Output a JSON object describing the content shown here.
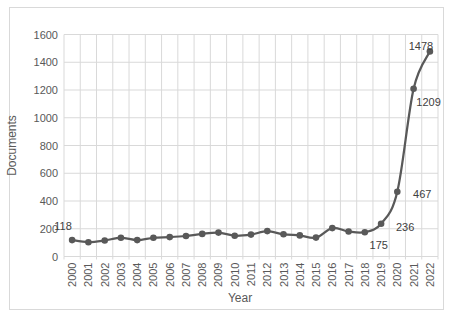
{
  "figure": {
    "background": "#ffffff",
    "border_color": "#d9d9d9"
  },
  "chart_data": {
    "type": "line",
    "title": "",
    "xlabel": "Year",
    "ylabel": "Documents",
    "categories": [
      "2000",
      "2001",
      "2002",
      "2003",
      "2004",
      "2005",
      "2006",
      "2007",
      "2008",
      "2009",
      "2010",
      "2011",
      "2012",
      "2013",
      "2014",
      "2015",
      "2016",
      "2017",
      "2018",
      "2019",
      "2020",
      "2021",
      "2022"
    ],
    "series": [
      {
        "name": "Documents",
        "values": [
          118,
          103,
          115,
          135,
          118,
          135,
          140,
          148,
          163,
          172,
          150,
          158,
          183,
          160,
          152,
          136,
          205,
          180,
          175,
          236,
          467,
          1209,
          1478
        ]
      }
    ],
    "ylim": [
      0,
      1600
    ],
    "y_ticks": [
      "0",
      "200",
      "400",
      "600",
      "800",
      "1000",
      "1200",
      "1400",
      "1600"
    ],
    "grid": "both",
    "legend": "none",
    "line_smoothing": true,
    "marker": "circle",
    "data_labels": [
      {
        "category": "2000",
        "text": "118",
        "dx": -9,
        "dy": -10
      },
      {
        "category": "2018",
        "text": "175",
        "dx": 14,
        "dy": 17
      },
      {
        "category": "2019",
        "text": "236",
        "dx": 24,
        "dy": 7
      },
      {
        "category": "2020",
        "text": "467",
        "dx": 25,
        "dy": 6
      },
      {
        "category": "2021",
        "text": "1209",
        "dx": 15,
        "dy": 17
      },
      {
        "category": "2022",
        "text": "1478",
        "dx": -9,
        "dy": -1
      }
    ],
    "colors": {
      "line": "#595959",
      "marker": "#595959",
      "grid": "#d9d9d9",
      "tick_text": "#595959",
      "axis_title_text": "#595959",
      "data_label_text": "#404040"
    }
  }
}
